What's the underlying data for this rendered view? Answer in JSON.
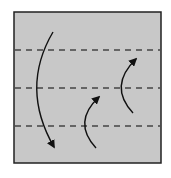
{
  "diagram": {
    "type": "origami-fold-diagram",
    "paper": {
      "x": 14,
      "y": 12,
      "width": 147,
      "height": 151,
      "fill": "#c8c8c8",
      "stroke": "#222222"
    },
    "valley_folds": [
      {
        "y": 50
      },
      {
        "y": 88
      },
      {
        "y": 126
      }
    ],
    "fold_line_color": "#444444",
    "arrows": [
      {
        "name": "fold-top-down-arrow",
        "path": "M53,32 Q20,88 54,147",
        "direction": "down"
      },
      {
        "name": "fold-bottom-up-arrow",
        "path": "M96,148 Q72,122 99,97",
        "direction": "up"
      },
      {
        "name": "fold-middle-up-arrow",
        "path": "M133,113 Q108,86 136,59",
        "direction": "up"
      }
    ],
    "arrow_color": "#111111"
  }
}
